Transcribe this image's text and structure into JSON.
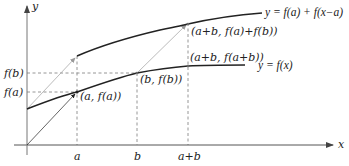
{
  "diagram": {
    "axes": {
      "x_label": "x",
      "y_label": "y",
      "x_ticks": [
        "a",
        "b",
        "a+b"
      ],
      "y_ticks": [
        "f(b)",
        "f(a)"
      ]
    },
    "curves": [
      {
        "name": "lower",
        "label": "y = f(x)"
      },
      {
        "name": "upper",
        "label": "y = f(a) + f(x−a)"
      }
    ],
    "points": [
      {
        "label": "(a, f(a))"
      },
      {
        "label": "(b, f(b))"
      },
      {
        "label": "(a+b, f(a+b))"
      },
      {
        "label": "(a+b, f(a)+f(b))"
      }
    ],
    "colors": {
      "curve": "#222222",
      "guide": "#8a8a8a",
      "arrow": "#a0a0a0",
      "axis": "#555555"
    }
  }
}
